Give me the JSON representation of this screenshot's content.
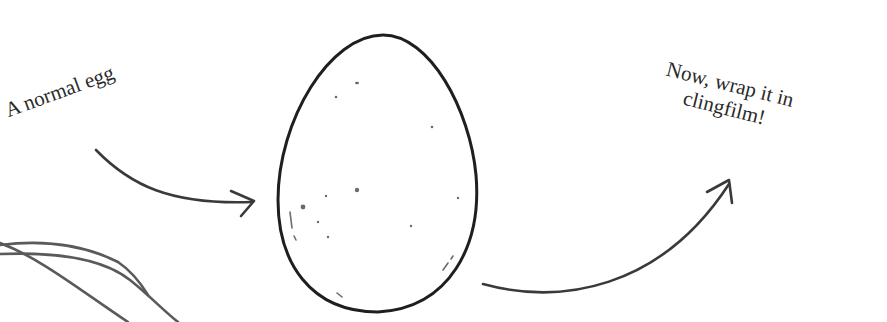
{
  "labels": {
    "left": "A normal egg",
    "right_line1": "Now, wrap it in",
    "right_line2": "clingfilm!"
  },
  "colors": {
    "background": "#ffffff",
    "ink": "#1f1f1f",
    "arrow": "#3a3a3a",
    "film_lines": "#5a5a5a",
    "speckle": "#6b6b6b"
  },
  "illustration": {
    "egg": {
      "cx": 379,
      "cy": 176,
      "shape": "egg-outline",
      "speckles": 14
    },
    "arrows": [
      {
        "name": "left-arrow",
        "from": "A normal egg",
        "to": "egg"
      },
      {
        "name": "right-arrow",
        "from": "egg",
        "to": "Now, wrap it in clingfilm!"
      }
    ],
    "clingfilm_curves": 3
  }
}
